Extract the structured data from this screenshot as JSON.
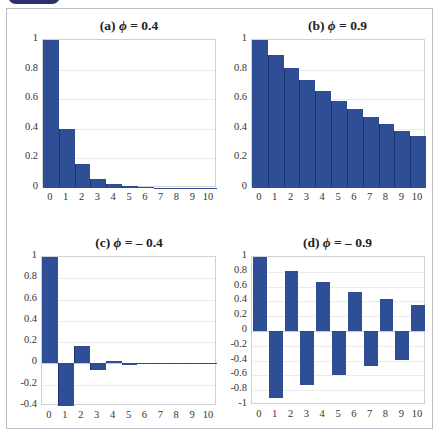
{
  "chart_data": [
    {
      "id": "a",
      "type": "bar",
      "title": "(a) ϕ = 0.4",
      "title_prefix": "(a)",
      "phi_label": "0.4",
      "categories": [
        "0",
        "1",
        "2",
        "3",
        "4",
        "5",
        "6",
        "7",
        "8",
        "9",
        "10"
      ],
      "values": [
        1,
        0.4,
        0.16,
        0.064,
        0.0256,
        0.0102,
        0.0041,
        0.0016,
        0.0007,
        0.0003,
        0.0001
      ],
      "yticks": [
        "1",
        "0.8",
        "0.6",
        "0.4",
        "0.2",
        "0"
      ],
      "ylim": [
        0,
        1
      ],
      "xlabel": "",
      "ylabel": "",
      "grid": true,
      "bar_gap": false
    },
    {
      "id": "b",
      "type": "bar",
      "title": "(b) ϕ = 0.9",
      "title_prefix": "(b)",
      "phi_label": "0.9",
      "categories": [
        "0",
        "1",
        "2",
        "3",
        "4",
        "5",
        "6",
        "7",
        "8",
        "9",
        "10"
      ],
      "values": [
        1,
        0.9,
        0.81,
        0.729,
        0.6561,
        0.5905,
        0.5314,
        0.4783,
        0.4305,
        0.3874,
        0.3487
      ],
      "yticks": [
        "1",
        "0.8",
        "0.6",
        "0.4",
        "0.2",
        "0"
      ],
      "ylim": [
        0,
        1
      ],
      "xlabel": "",
      "ylabel": "",
      "grid": true,
      "bar_gap": false
    },
    {
      "id": "c",
      "type": "bar",
      "title": "(c) ϕ = – 0.4",
      "title_prefix": "(c)",
      "phi_label": "– 0.4",
      "categories": [
        "0",
        "1",
        "2",
        "3",
        "4",
        "5",
        "6",
        "7",
        "8",
        "9",
        "10"
      ],
      "values": [
        1,
        -0.4,
        0.16,
        -0.064,
        0.0256,
        -0.0102,
        0.0041,
        -0.0016,
        0.0007,
        -0.0003,
        0.0001
      ],
      "yticks": [
        "1",
        "0.8",
        "0.6",
        "0.4",
        "0.2",
        "0",
        "-0.2",
        "-0.4"
      ],
      "ylim": [
        -0.4,
        1
      ],
      "xlabel": "",
      "ylabel": "",
      "grid": true,
      "bar_gap": false
    },
    {
      "id": "d",
      "type": "bar",
      "title": "(d) ϕ = – 0.9",
      "title_prefix": "(d)",
      "phi_label": "– 0.9",
      "categories": [
        "0",
        "1",
        "2",
        "3",
        "4",
        "5",
        "6",
        "7",
        "8",
        "9",
        "10"
      ],
      "values": [
        1,
        -0.9,
        0.81,
        -0.729,
        0.6561,
        -0.5905,
        0.5314,
        -0.4783,
        0.4305,
        -0.3874,
        0.3487
      ],
      "yticks": [
        "1",
        "0.8",
        "0.6",
        "0.4",
        "0.2",
        "0",
        "-0.2",
        "-0.4",
        "-0.6",
        "-0.8",
        "-1"
      ],
      "ylim": [
        -1,
        1
      ],
      "xlabel": "",
      "ylabel": "",
      "grid": true,
      "bar_gap": true
    }
  ],
  "colors": {
    "bar": "#2e4f96",
    "header_tab": "#2b2f6b",
    "frame_border": "#b9bcc4"
  },
  "phi_symbol": "ϕ"
}
